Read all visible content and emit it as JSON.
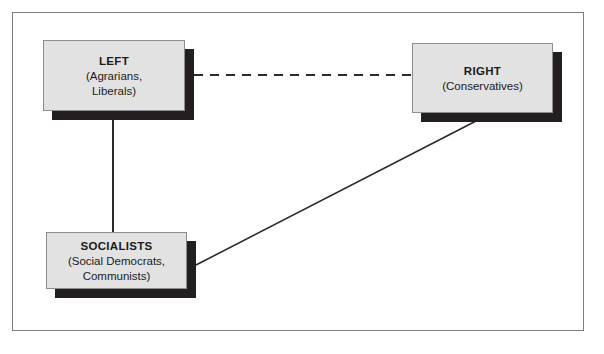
{
  "diagram": {
    "type": "political-spectrum-relationship-diagram",
    "frame": {
      "visible": true,
      "border_color": "#7c7c82"
    },
    "nodes": [
      {
        "id": "left",
        "title": "LEFT",
        "subtitle_lines": [
          "(Agrarians,",
          "Liberals)"
        ],
        "fill_color": "#e2e2e2",
        "border_color": "#8d8d92",
        "shadow_color": "#231f20"
      },
      {
        "id": "right",
        "title": "RIGHT",
        "subtitle_lines": [
          "(Conservatives)"
        ],
        "fill_color": "#e2e2e2",
        "border_color": "#8d8d92",
        "shadow_color": "#231f20"
      },
      {
        "id": "socialists",
        "title": "SOCIALISTS",
        "subtitle_lines": [
          "(Social Democrats,",
          "Communists)"
        ],
        "fill_color": "#e2e2e2",
        "border_color": "#8d8d92",
        "shadow_color": "#231f20"
      }
    ],
    "connectors": [
      {
        "id": "left-right",
        "from": "left",
        "to": "right",
        "style": "dashed",
        "color": "#2b2b2b"
      },
      {
        "id": "left-socialists",
        "from": "left",
        "to": "socialists",
        "style": "solid",
        "color": "#2b2b2b"
      },
      {
        "id": "socialists-right",
        "from": "socialists",
        "to": "right",
        "style": "solid",
        "color": "#2b2b2b"
      }
    ]
  }
}
